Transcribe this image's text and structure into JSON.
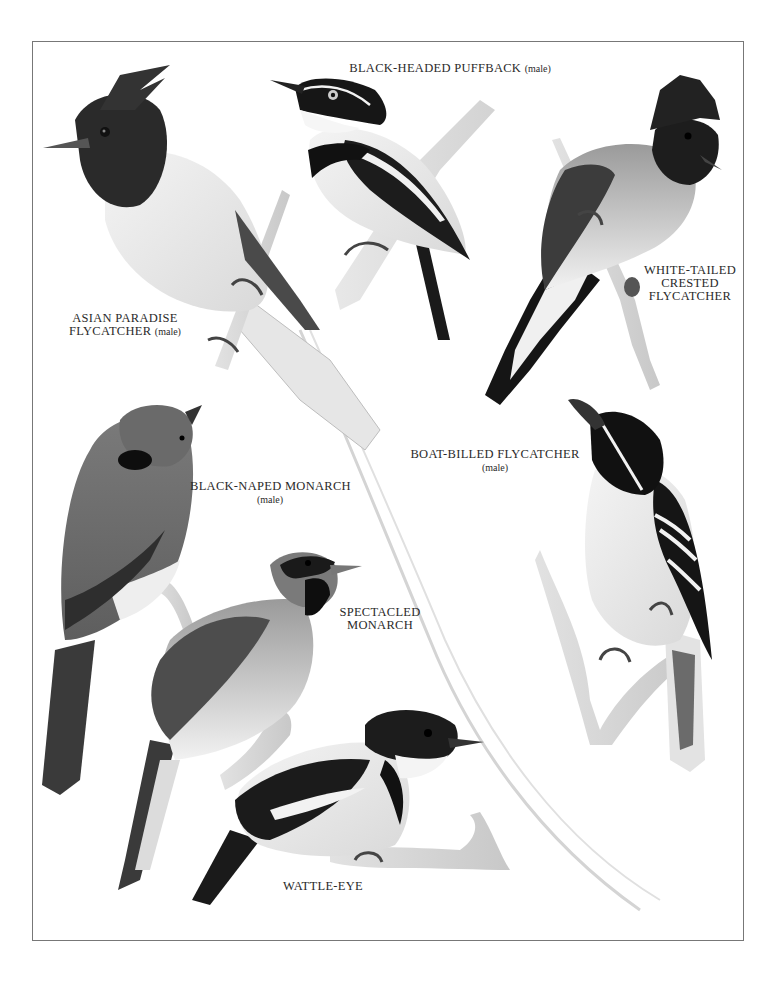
{
  "plate": {
    "type": "ornithological illustration plate",
    "style": "monochrome painted illustration",
    "frame_color": "#777777",
    "background": "#ffffff"
  },
  "birds": [
    {
      "id": "black-headed-puffback",
      "name": "BLACK-HEADED PUFFBACK",
      "qualifier": "(male)",
      "label_lines": [
        "BLACK-HEADED PUFFBACK"
      ],
      "position": "top-center"
    },
    {
      "id": "asian-paradise-flycatcher",
      "name": "ASIAN PARADISE FLYCATCHER",
      "qualifier": "(male)",
      "label_lines": [
        "ASIAN PARADISE",
        "FLYCATCHER"
      ],
      "position": "top-left"
    },
    {
      "id": "white-tailed-crested-flycatcher",
      "name": "WHITE-TAILED CRESTED FLYCATCHER",
      "qualifier": "",
      "label_lines": [
        "WHITE-TAILED",
        "CRESTED",
        "FLYCATCHER"
      ],
      "position": "top-right"
    },
    {
      "id": "boat-billed-flycatcher",
      "name": "BOAT-BILLED FLYCATCHER",
      "qualifier": "(male)",
      "label_lines": [
        "BOAT-BILLED FLYCATCHER"
      ],
      "position": "middle-right"
    },
    {
      "id": "black-naped-monarch",
      "name": "BLACK-NAPED MONARCH",
      "qualifier": "(male)",
      "label_lines": [
        "BLACK-NAPED MONARCH"
      ],
      "position": "middle-left"
    },
    {
      "id": "spectacled-monarch",
      "name": "SPECTACLED MONARCH",
      "qualifier": "",
      "label_lines": [
        "SPECTACLED",
        "MONARCH"
      ],
      "position": "lower-center"
    },
    {
      "id": "wattle-eye",
      "name": "WATTLE-EYE",
      "qualifier": "",
      "label_lines": [
        "WATTLE-EYE"
      ],
      "position": "bottom-center"
    }
  ]
}
